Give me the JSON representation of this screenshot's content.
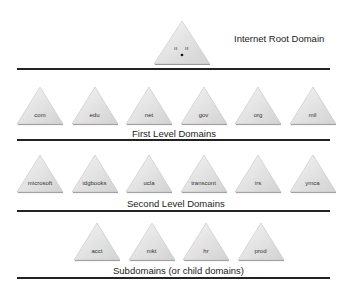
{
  "root": {
    "label": "Internet Root Domain",
    "glyph": "ıı ıı •"
  },
  "levels": [
    {
      "caption": "First Level Domains",
      "domains": [
        "com",
        "edu",
        "net",
        "gov",
        "org",
        "mil"
      ]
    },
    {
      "caption": "Second Level Domains",
      "domains": [
        "microsoft",
        "idgbooks",
        "ucla",
        "transcont",
        "irs",
        "ymca"
      ]
    },
    {
      "caption": "Subdomains (or child domains)",
      "domains": [
        "acct",
        "mkt",
        "hr",
        "prod"
      ]
    }
  ],
  "colors": {
    "triangle_fill": "#e2e2e2",
    "triangle_light": "#f2f2f2",
    "triangle_edge": "#bdbdbd",
    "rule": "#222222"
  }
}
